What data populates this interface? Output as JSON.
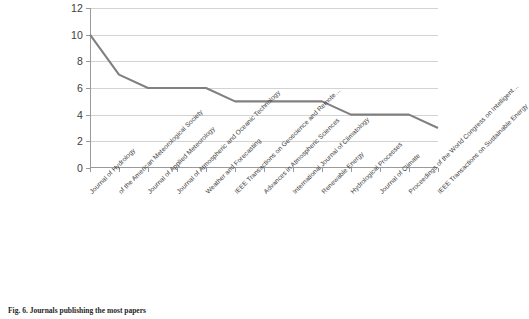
{
  "caption": "Fig. 6. Journals publishing the most papers",
  "chart_data": {
    "type": "line",
    "title": "",
    "xlabel": "",
    "ylabel": "",
    "ylim": [
      0,
      12
    ],
    "yticks": [
      0,
      2,
      4,
      6,
      8,
      10,
      12
    ],
    "grid": true,
    "legend": false,
    "line_color": "#808080",
    "categories": [
      "Journal of Hydrology",
      "of the American Meteorological Society",
      "Journal of Applied Meteorology",
      "Journal of Atmospheric and Oceanic Technology",
      "Weather and Forecasting",
      "IEEE Transactions on Geoscience and Remote…",
      "Advances in Atmospheric Sciences",
      "International Journal of Climatology",
      "Renewable Energy",
      "Hydrological Processes",
      "Journal of Climate",
      "Proceedings of the World Congress on Intelligent…",
      "IEEE Transactions on Sustainable Energy"
    ],
    "values": [
      10,
      7,
      6,
      6,
      6,
      5,
      5,
      5,
      5,
      4,
      4,
      4,
      3
    ]
  }
}
